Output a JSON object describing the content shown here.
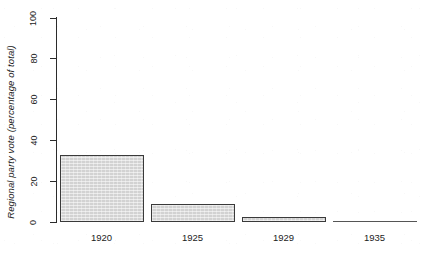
{
  "chart_data": {
    "type": "bar",
    "title": "",
    "subtitle": "",
    "xlabel": "",
    "ylabel": "Regional party vote (percentage of total)",
    "categories": [
      "1920",
      "1925",
      "1929",
      "1935"
    ],
    "values": [
      33,
      9,
      2.5,
      0
    ],
    "ylim": [
      0,
      100
    ],
    "yticks": [
      0,
      20,
      40,
      60,
      80,
      100
    ],
    "ytick_labels": [
      "0",
      "20",
      "40",
      "60",
      "80",
      "100"
    ],
    "grid": false,
    "legend": null,
    "legend_position": "none",
    "annotations": [],
    "series": [
      {
        "name": "Regional party vote",
        "values": [
          33,
          9,
          2.5,
          0
        ]
      }
    ],
    "style": {
      "bar_fill": "#d2d2d2",
      "bar_edge": "#3a3a3a",
      "axis_color": "#2b2b2b",
      "text_color": "#1c1c1c",
      "background": "#ffffff",
      "ylabel_italic": true,
      "spines": [
        "left"
      ]
    }
  },
  "axis": {
    "y_title": "Regional party vote (percentage of total)",
    "ticks": [
      {
        "value": 100,
        "label": "100"
      },
      {
        "value": 80,
        "label": "80"
      },
      {
        "value": 60,
        "label": "60"
      },
      {
        "value": 40,
        "label": "40"
      },
      {
        "value": 20,
        "label": "20"
      },
      {
        "value": 0,
        "label": "0"
      }
    ]
  },
  "bars": [
    {
      "category": "1920",
      "value": 33,
      "label": "1920"
    },
    {
      "category": "1925",
      "value": 9,
      "label": "1925"
    },
    {
      "category": "1929",
      "value": 2.5,
      "label": "1929"
    },
    {
      "category": "1935",
      "value": 0,
      "label": "1935"
    }
  ]
}
